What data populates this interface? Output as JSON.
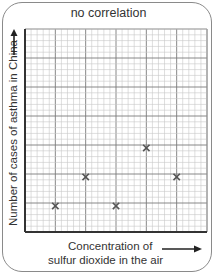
{
  "chart_data": {
    "type": "scatter",
    "title": "no correlation",
    "xlabel": "Concentration of sulfur dioxide in the air",
    "xlabel_lines": [
      "Concentration of",
      "sulfur dioxide in the air"
    ],
    "ylabel": "Number of cases of asthma in China",
    "axis_arrows": true,
    "tick_labels": false,
    "grid": true,
    "grid_style": "graph paper: major lines every 5 minor squares",
    "xlim": [
      0,
      6
    ],
    "ylim": [
      0,
      7
    ],
    "units": "major grid squares (no numeric tick labels shown)",
    "marker": "x",
    "marker_color": "#555555",
    "points": [
      {
        "x": 1,
        "y": 0.9
      },
      {
        "x": 2,
        "y": 1.9
      },
      {
        "x": 3,
        "y": 0.9
      },
      {
        "x": 4,
        "y": 2.9
      },
      {
        "x": 5,
        "y": 1.9
      }
    ],
    "note": "Values estimated from grid position; the chart has no numeric axis labels."
  },
  "colors": {
    "frame": "#8a8a8a",
    "grid_major": "#7a7a7a",
    "grid_minor": "#c8c8c8",
    "axis": "#333333",
    "text": "#333333"
  }
}
